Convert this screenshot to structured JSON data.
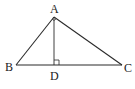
{
  "diagram": {
    "type": "geometry",
    "points": {
      "A": {
        "label": "A",
        "x": 54,
        "y": 17
      },
      "B": {
        "label": "B",
        "x": 16,
        "y": 65
      },
      "C": {
        "label": "C",
        "x": 122,
        "y": 65
      },
      "D": {
        "label": "D",
        "x": 54,
        "y": 65
      }
    },
    "segments": [
      "AB",
      "AC",
      "BC",
      "AD"
    ],
    "annotations": {
      "right_angle_at": "D",
      "angle_arc_at": "A"
    },
    "colors": {
      "stroke": "#2a2a2a",
      "background": "#ffffff"
    }
  }
}
